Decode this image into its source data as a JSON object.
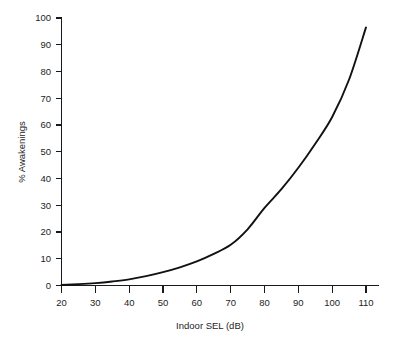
{
  "chart_data": {
    "type": "line",
    "title": "",
    "xlabel": "Indoor SEL (dB)",
    "ylabel": "% Awakenings",
    "xlim": [
      20,
      110
    ],
    "ylim": [
      0,
      100
    ],
    "xticks": [
      20,
      30,
      40,
      50,
      60,
      70,
      80,
      90,
      100,
      110
    ],
    "yticks": [
      0,
      10,
      20,
      30,
      40,
      50,
      60,
      70,
      80,
      90,
      100
    ],
    "xtick_labels": [
      "20",
      "30",
      "40",
      "50",
      "60",
      "70",
      "80",
      "90",
      "100",
      "110"
    ],
    "ytick_labels": [
      "0",
      "10",
      "20",
      "30",
      "40",
      "50",
      "60",
      "70",
      "80",
      "90",
      "100"
    ],
    "grid": false,
    "legend": false,
    "legend_position": "none",
    "series": [
      {
        "name": "% Awakenings",
        "color": "#111111",
        "x": [
          20,
          25,
          30,
          35,
          40,
          45,
          50,
          55,
          60,
          65,
          70,
          75,
          80,
          85,
          90,
          95,
          100,
          105,
          110
        ],
        "values": [
          0.2,
          0.5,
          0.9,
          1.5,
          2.3,
          3.5,
          5.0,
          6.8,
          9.0,
          11.8,
          15.2,
          21.0,
          29.0,
          36.0,
          44.0,
          53.0,
          63.0,
          77.0,
          96.5
        ]
      }
    ],
    "annotations": []
  },
  "axis": {
    "x_title": "Indoor SEL (dB)",
    "y_title": "% Awakenings"
  },
  "colors": {
    "curve": "#111111",
    "axis": "#1a1a1a",
    "text": "#1d1d1d",
    "background": "#ffffff"
  }
}
